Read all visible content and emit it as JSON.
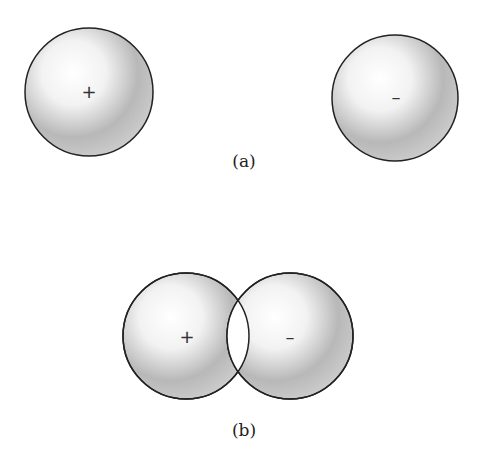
{
  "figure": {
    "panel_a": {
      "label": "(a)",
      "left_sphere": {
        "charge": "+",
        "cx": 89,
        "cy": 92,
        "r": 64
      },
      "right_sphere": {
        "charge": "–",
        "cx": 395,
        "cy": 98,
        "r": 63
      }
    },
    "panel_b": {
      "label": "(b)",
      "left_sphere": {
        "charge": "+",
        "cx": 186,
        "cy": 336,
        "r": 63
      },
      "right_sphere": {
        "charge": "–",
        "cx": 290,
        "cy": 336,
        "r": 63
      }
    }
  }
}
